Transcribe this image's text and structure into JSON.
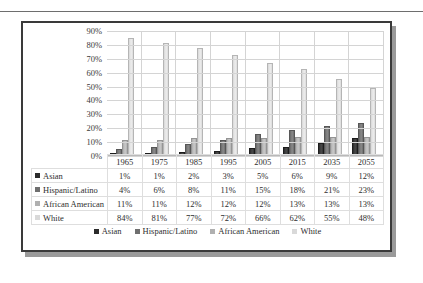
{
  "chart_data": {
    "type": "bar",
    "title": "",
    "subtitle": "",
    "xlabel": "",
    "ylabel": "",
    "ylim": [
      0,
      90
    ],
    "ytick_labels": [
      "90%",
      "80%",
      "70%",
      "60%",
      "50%",
      "40%",
      "30%",
      "20%",
      "10%",
      "0%"
    ],
    "ytick_values": [
      90,
      80,
      70,
      60,
      50,
      40,
      30,
      20,
      10,
      0
    ],
    "grid": true,
    "legend_position": "bottom",
    "categories": [
      "1965",
      "1975",
      "1985",
      "1995",
      "2005",
      "2015",
      "2035",
      "2055"
    ],
    "series": [
      {
        "name": "Asian",
        "color": "#2b2b2b",
        "values": [
          1,
          1,
          2,
          3,
          5,
          6,
          9,
          12
        ],
        "labels": [
          "1%",
          "1%",
          "2%",
          "3%",
          "5%",
          "6%",
          "9%",
          "12%"
        ]
      },
      {
        "name": "Hispanic/Latino",
        "color": "#6f6f6f",
        "values": [
          4,
          6,
          8,
          11,
          15,
          18,
          21,
          23
        ],
        "labels": [
          "4%",
          "6%",
          "8%",
          "11%",
          "15%",
          "18%",
          "21%",
          "23%"
        ]
      },
      {
        "name": "African American",
        "color": "#b0b0b0",
        "values": [
          11,
          11,
          12,
          12,
          12,
          13,
          13,
          13
        ],
        "labels": [
          "11%",
          "11%",
          "12%",
          "12%",
          "12%",
          "13%",
          "13%",
          "13%"
        ]
      },
      {
        "name": "White",
        "color": "#d9d9d9",
        "values": [
          84,
          81,
          77,
          72,
          66,
          62,
          55,
          48
        ],
        "labels": [
          "84%",
          "81%",
          "77%",
          "72%",
          "66%",
          "62%",
          "55%",
          "48%"
        ]
      }
    ]
  },
  "data_table": {
    "header_blank": "",
    "columns": [
      "1965",
      "1975",
      "1985",
      "1995",
      "2005",
      "2015",
      "2035",
      "2055"
    ],
    "rows": [
      {
        "label": "Asian",
        "swatch": "sw0",
        "values": [
          "1%",
          "1%",
          "2%",
          "3%",
          "5%",
          "6%",
          "9%",
          "12%"
        ]
      },
      {
        "label": "Hispanic/Latino",
        "swatch": "sw1",
        "values": [
          "4%",
          "6%",
          "8%",
          "11%",
          "15%",
          "18%",
          "21%",
          "23%"
        ]
      },
      {
        "label": "African American",
        "swatch": "sw2",
        "values": [
          "11%",
          "11%",
          "12%",
          "12%",
          "12%",
          "13%",
          "13%",
          "13%"
        ]
      },
      {
        "label": "White",
        "swatch": "sw3",
        "values": [
          "84%",
          "81%",
          "77%",
          "72%",
          "66%",
          "62%",
          "55%",
          "48%"
        ]
      }
    ]
  },
  "legend": {
    "items": [
      {
        "label": "Asian",
        "swatch": "sw0"
      },
      {
        "label": "Hispanic/Latino",
        "swatch": "sw1"
      },
      {
        "label": "African American",
        "swatch": "sw2"
      },
      {
        "label": "White",
        "swatch": "sw3"
      }
    ]
  }
}
